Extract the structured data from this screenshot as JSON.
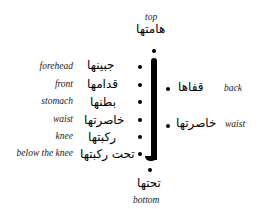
{
  "top": {
    "english": "top",
    "arabic": "هامتها"
  },
  "bottom": {
    "english": "bottom",
    "arabic": "تحتها"
  },
  "left_labels": [
    {
      "english": "forehead",
      "arabic": "جبينها"
    },
    {
      "english": "front",
      "arabic": "قدامها"
    },
    {
      "english": "stomach",
      "arabic": "بطنها"
    },
    {
      "english": "waist",
      "arabic": "خاصرتها"
    },
    {
      "english": "knee",
      "arabic": "ركبتها"
    },
    {
      "english": "below the knee",
      "arabic": "تحت ركبتها"
    }
  ],
  "right_labels": [
    {
      "english": "back",
      "arabic": "قفاها"
    },
    {
      "english": "waist",
      "arabic": "خاصرتها"
    }
  ]
}
